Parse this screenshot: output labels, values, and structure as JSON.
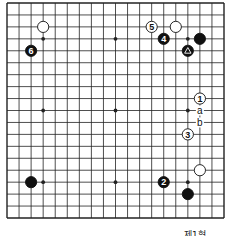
{
  "diagram": {
    "type": "go-board",
    "size": 19,
    "caption": "제1형",
    "colors": {
      "line": "#222222",
      "black": "#111111",
      "white": "#ffffff",
      "background": "#ffffff"
    },
    "hoshi": [
      [
        3,
        3
      ],
      [
        9,
        3
      ],
      [
        15,
        3
      ],
      [
        3,
        9
      ],
      [
        9,
        9
      ],
      [
        15,
        9
      ],
      [
        3,
        15
      ],
      [
        9,
        15
      ],
      [
        15,
        15
      ]
    ],
    "stones": [
      {
        "color": "white",
        "col": 3,
        "row": 2,
        "label": ""
      },
      {
        "color": "black",
        "col": 2,
        "row": 4,
        "label": "6"
      },
      {
        "color": "white",
        "col": 12,
        "row": 2,
        "label": "5"
      },
      {
        "color": "white",
        "col": 14,
        "row": 2,
        "label": ""
      },
      {
        "color": "black",
        "col": 13,
        "row": 3,
        "label": "4"
      },
      {
        "color": "black",
        "col": 16,
        "row": 3,
        "label": ""
      },
      {
        "color": "black",
        "col": 15,
        "row": 4,
        "label": "△"
      },
      {
        "color": "white",
        "col": 16,
        "row": 8,
        "label": "1"
      },
      {
        "color": "white",
        "col": 15,
        "row": 11,
        "label": "3"
      },
      {
        "color": "white",
        "col": 16,
        "row": 14,
        "label": ""
      },
      {
        "color": "black",
        "col": 13,
        "row": 15,
        "label": "2"
      },
      {
        "color": "black",
        "col": 15,
        "row": 16,
        "label": ""
      },
      {
        "color": "black",
        "col": 2,
        "row": 15,
        "label": ""
      }
    ],
    "markers": [
      {
        "col": 16,
        "row": 9,
        "label": "a"
      },
      {
        "col": 16,
        "row": 10,
        "label": "b"
      }
    ]
  }
}
